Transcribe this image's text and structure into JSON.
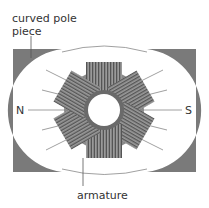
{
  "labels": {
    "pole_piece_line1": "curved pole",
    "pole_piece_line2": "piece",
    "north": "N",
    "south": "S",
    "armature": "armature"
  },
  "colors": {
    "pole": "#7a7a7a",
    "armature": "#8a8a8a",
    "winding": "#5c5c5c",
    "field_line": "#888888",
    "text": "#333333"
  }
}
